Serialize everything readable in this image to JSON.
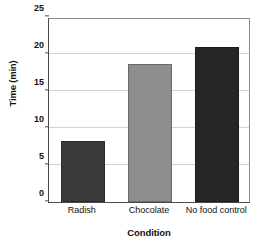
{
  "chart_data": {
    "type": "bar",
    "title": "",
    "categories": [
      "Radish",
      "Chocolate",
      "No food control"
    ],
    "values": [
      8.2,
      18.7,
      20.9
    ],
    "series": [
      {
        "name": "Time (min)",
        "values": [
          8.2,
          18.7,
          20.9
        ]
      }
    ],
    "xlabel": "Condition",
    "ylabel": "Time (min)",
    "ylim": [
      0,
      25
    ],
    "ytick_values": [
      0,
      5,
      10,
      15,
      20,
      25
    ],
    "ytick_labels": [
      "0",
      "5",
      "10",
      "15",
      "20",
      "25"
    ],
    "ytick_step": 5,
    "grid": true,
    "grid_axis": "y",
    "legend": false,
    "legend_position": "none",
    "bar_colors": [
      "#3b3b3b",
      "#8e8e8e",
      "#262626"
    ],
    "plot_border_color": "#8c8c8c",
    "axis_color": "#4a4a4a",
    "gridline_color": "#d2d2d2",
    "background_color": "#ffffff"
  },
  "axes": {
    "y_title": "Time (min)",
    "x_title": "Condition"
  }
}
